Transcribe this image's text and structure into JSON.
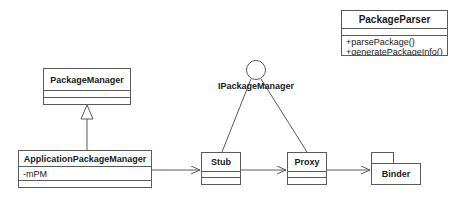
{
  "diagram": {
    "type": "uml-class-diagram",
    "background_color": "#ffffff",
    "line_color": "#5a5a5a",
    "text_color": "#1a1a1a"
  },
  "classes": {
    "package_parser": {
      "name": "PackageParser",
      "attributes": [],
      "methods": [
        "+parsePackage()",
        "+generatePackageInfo()"
      ]
    },
    "package_manager": {
      "name": "PackageManager",
      "attributes": [],
      "methods": []
    },
    "application_package_manager": {
      "name": "ApplicationPackageManager",
      "attributes": [
        "-mPM"
      ],
      "methods": []
    },
    "stub": {
      "name": "Stub",
      "attributes": [],
      "methods": []
    },
    "proxy": {
      "name": "Proxy",
      "attributes": [],
      "methods": []
    }
  },
  "interface": {
    "name": "IPackageManager",
    "notation": "lollipop"
  },
  "package_node": {
    "name": "Binder",
    "notation": "package-folder"
  },
  "relationships": [
    {
      "kind": "generalization",
      "from": "ApplicationPackageManager",
      "to": "PackageManager",
      "marker": "hollow-triangle"
    },
    {
      "kind": "association",
      "from": "ApplicationPackageManager",
      "to": "Stub",
      "marker": "open-arrow"
    },
    {
      "kind": "association",
      "from": "Stub",
      "to": "Proxy",
      "marker": "open-arrow"
    },
    {
      "kind": "association",
      "from": "Proxy",
      "to": "Binder",
      "marker": "open-arrow"
    },
    {
      "kind": "realization",
      "from": "Stub",
      "to": "IPackageManager",
      "marker": "line"
    },
    {
      "kind": "realization",
      "from": "Proxy",
      "to": "IPackageManager",
      "marker": "line"
    }
  ]
}
